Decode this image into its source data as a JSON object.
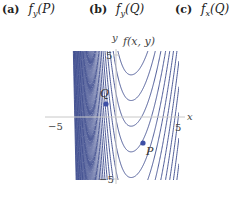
{
  "options": [
    {
      "label": "(a)",
      "expr": "f_y(P)",
      "main": "f",
      "sub": "y",
      "arg": "(P)"
    },
    {
      "label": "(b)",
      "expr": "f_y(Q)",
      "main": "f",
      "sub": "y",
      "arg": "(Q)"
    },
    {
      "label": "(c)",
      "expr": "f_x(Q)",
      "main": "f",
      "sub": "x",
      "arg": "(Q)"
    }
  ],
  "plot": {
    "title": "f(x, y)",
    "x_axis_label": "x",
    "y_axis_label": "y",
    "x_range": [
      -5,
      5
    ],
    "y_range": [
      -5,
      5
    ],
    "tick_labels": {
      "x_min": "−5",
      "x_max": "5",
      "y_min": "−5",
      "y_max": "5"
    },
    "contour_color": "#3b4a8c",
    "point_color": "#3d4fa6",
    "points": [
      {
        "name": "Q",
        "x": -0.85,
        "y": 1.05
      },
      {
        "name": "P",
        "x": 2.2,
        "y": -2.1
      }
    ],
    "contour_model": {
      "form": "y - g(x) = c",
      "vertex_x": 1.25,
      "right_coeff": 1.0,
      "left_coeff": 1.0,
      "left_cubic": 0.55,
      "levels_start": -40,
      "levels_step": 2.07,
      "levels_count": 40,
      "level_offset": 3.4
    }
  }
}
